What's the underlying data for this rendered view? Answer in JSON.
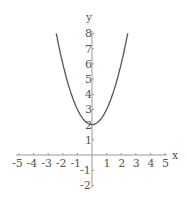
{
  "chart_data": {
    "type": "line",
    "title": "",
    "function": "y = x^2 + 2",
    "xlabel": "x",
    "ylabel": "y",
    "xlim": [
      -5,
      5
    ],
    "ylim": [
      -2,
      8
    ],
    "x_ticks": [
      "-5",
      "-4",
      "-3",
      "-2",
      "-1",
      "1",
      "2",
      "3",
      "4",
      "5"
    ],
    "y_ticks": [
      "-2",
      "-1",
      "1",
      "2",
      "3",
      "4",
      "5",
      "6",
      "7",
      "8"
    ],
    "series": [
      {
        "name": "parabola",
        "x": [
          -2.45,
          -2,
          -1.5,
          -1,
          -0.5,
          0,
          0.5,
          1,
          1.5,
          2,
          2.45
        ],
        "y": [
          8,
          6,
          4.25,
          3,
          2.25,
          2,
          2.25,
          3,
          4.25,
          6,
          8
        ]
      }
    ],
    "grid": false,
    "legend": "none",
    "line_color": "#555555"
  }
}
